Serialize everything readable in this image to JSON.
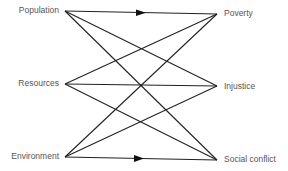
{
  "diagram": {
    "left_nodes": [
      {
        "id": "population",
        "label": "Population",
        "x": 65,
        "y": 11
      },
      {
        "id": "resources",
        "label": "Resources",
        "x": 65,
        "y": 84
      },
      {
        "id": "environment",
        "label": "Environment",
        "x": 65,
        "y": 157
      }
    ],
    "right_nodes": [
      {
        "id": "poverty",
        "label": "Poverty",
        "x": 217,
        "y": 14
      },
      {
        "id": "injustice",
        "label": "Injustice",
        "x": 217,
        "y": 86
      },
      {
        "id": "social_conflict",
        "label": "Social conflict",
        "x": 217,
        "y": 160
      }
    ],
    "edges": [
      {
        "from": "population",
        "to": "poverty",
        "mid_arrow": true
      },
      {
        "from": "population",
        "to": "injustice",
        "mid_arrow": false
      },
      {
        "from": "population",
        "to": "social_conflict",
        "mid_arrow": false
      },
      {
        "from": "resources",
        "to": "poverty",
        "mid_arrow": false
      },
      {
        "from": "resources",
        "to": "injustice",
        "mid_arrow": false
      },
      {
        "from": "resources",
        "to": "social_conflict",
        "mid_arrow": false
      },
      {
        "from": "environment",
        "to": "poverty",
        "mid_arrow": false
      },
      {
        "from": "environment",
        "to": "injustice",
        "mid_arrow": false
      },
      {
        "from": "environment",
        "to": "social_conflict",
        "mid_arrow": true
      }
    ],
    "colors": {
      "line": "#222222",
      "text": "#555555",
      "background": "#ffffff"
    }
  }
}
